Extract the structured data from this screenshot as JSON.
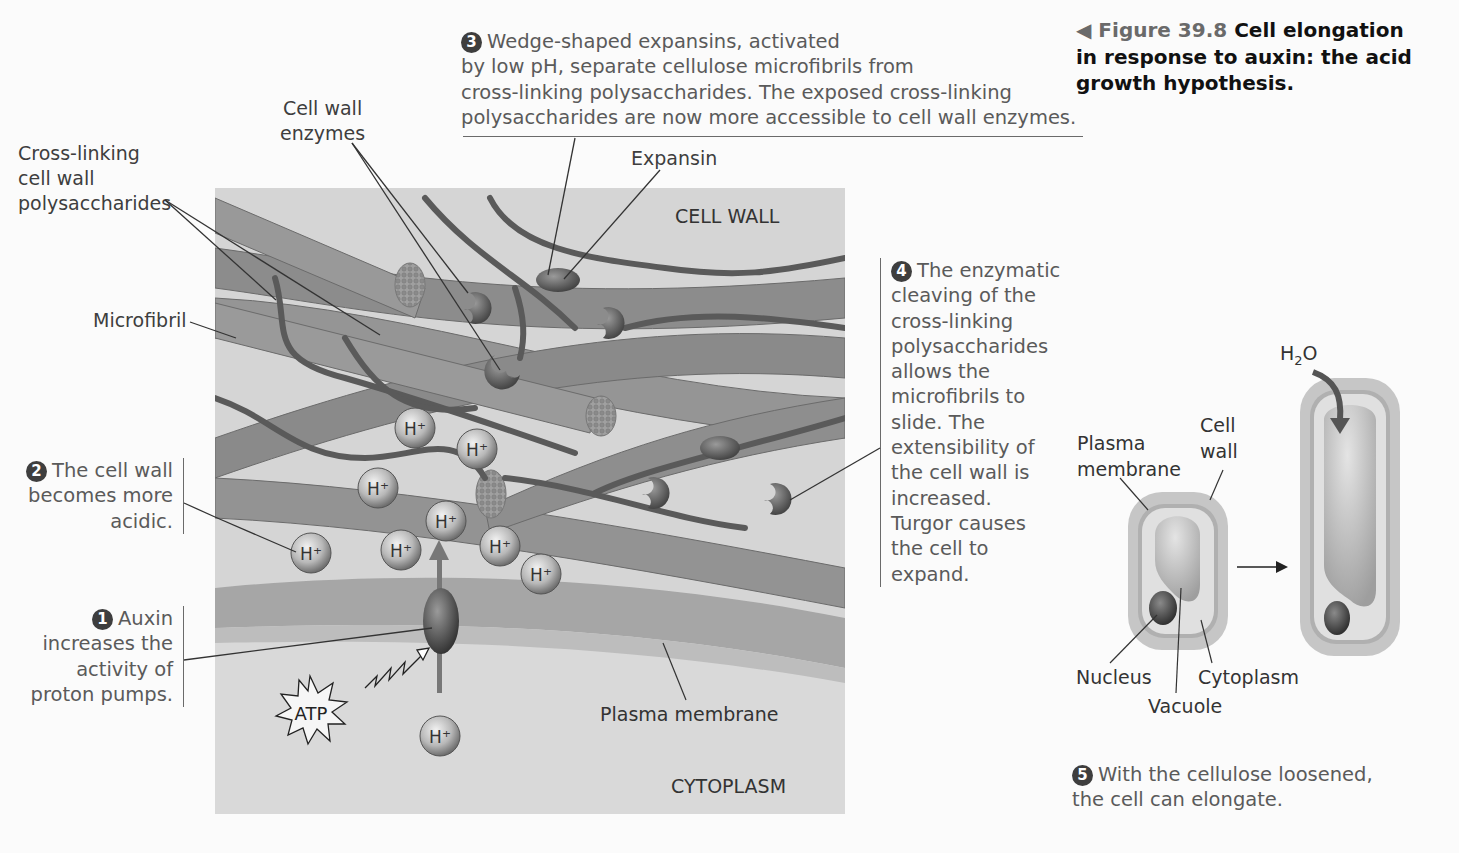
{
  "figure": {
    "marker": "◀",
    "number": "Figure 39.8",
    "title": "Cell elongation in response to auxin: the acid growth hypothesis.",
    "title_lines": [
      "Cell elongation",
      "in response to auxin: the acid",
      "growth hypothesis."
    ]
  },
  "steps": [
    {
      "num": "1",
      "lines": [
        "Auxin",
        "increases the",
        "activity of",
        "proton pumps."
      ]
    },
    {
      "num": "2",
      "lines": [
        "The cell wall",
        "becomes more",
        "acidic."
      ]
    },
    {
      "num": "3",
      "lines": [
        "Wedge-shaped expansins, activated",
        "by low pH, separate cellulose microfibrils from",
        "cross-linking polysaccharides. The exposed cross-linking",
        "polysaccharides are now more accessible to cell wall enzymes."
      ]
    },
    {
      "num": "4",
      "lines": [
        "The enzymatic",
        "cleaving of the",
        "cross-linking",
        "polysaccharides",
        "allows the",
        "microfibrils to",
        "slide. The",
        "extensibility of",
        "the cell wall is",
        "increased.",
        "Turgor causes",
        "the cell to",
        "expand."
      ]
    },
    {
      "num": "5",
      "lines": [
        "With the cellulose loosened,",
        "the cell can elongate."
      ]
    }
  ],
  "labels": {
    "cell_wall_enzymes": [
      "Cell wall",
      "enzymes"
    ],
    "cross_linking": [
      "Cross-linking",
      "cell wall",
      "polysaccharides"
    ],
    "microfibril": "Microfibril",
    "expansin": "Expansin",
    "cell_wall_region": "CELL WALL",
    "cytoplasm_region": "CYTOPLASM",
    "plasma_membrane": "Plasma membrane",
    "atp": "ATP",
    "proton": "H",
    "proton_charge": "+"
  },
  "cell_diagram": {
    "plasma_membrane": [
      "Plasma",
      "membrane"
    ],
    "cell_wall": [
      "Cell",
      "wall"
    ],
    "nucleus": "Nucleus",
    "vacuole": "Vacuole",
    "cytoplasm": "Cytoplasm",
    "water": "H",
    "water_sub": "2",
    "water_o": "O"
  },
  "colors": {
    "panel_bg": "#d5d5d5",
    "fibril": "#8a8a8a",
    "polysaccharide": "#5e5e5e",
    "membrane": "#a9a9a9",
    "text": "#3e3e3e"
  }
}
